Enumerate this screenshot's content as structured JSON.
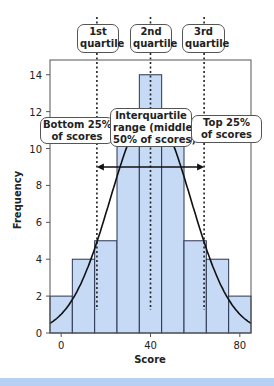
{
  "chart_data": {
    "type": "bar",
    "subtype": "histogram with normal curve",
    "title": "",
    "xlabel": "Score",
    "ylabel": "Frequency",
    "categories": [
      0,
      10,
      20,
      30,
      40,
      50,
      60,
      70,
      80
    ],
    "bin_width": 10,
    "values": [
      2,
      4,
      5,
      11,
      14,
      11,
      5,
      4,
      2
    ],
    "xlim": [
      -5,
      85
    ],
    "ylim": [
      0,
      14.8
    ],
    "x_ticks": [
      0,
      40,
      80
    ],
    "y_ticks": [
      0,
      2,
      4,
      6,
      8,
      10,
      12,
      14
    ],
    "grid": false,
    "normal_curve": {
      "mean": 40,
      "sd": 18,
      "peak": 12
    },
    "quartile_lines": [
      {
        "label_line1": "1st",
        "label_line2": "quartile",
        "x": 16
      },
      {
        "label_line1": "2nd",
        "label_line2": "quartile",
        "x": 40
      },
      {
        "label_line1": "3rd",
        "label_line2": "quartile",
        "x": 64
      }
    ],
    "annotations": [
      {
        "id": "bottom",
        "line1": "Bottom 25%",
        "line2": "of scores"
      },
      {
        "id": "iqr",
        "line1": "Interquartile",
        "line2": "range (middle",
        "line3": "50% of scores)"
      },
      {
        "id": "top",
        "line1": "Top 25%",
        "line2": "of scores"
      }
    ],
    "iqr_arrow": {
      "from": 16,
      "to": 64,
      "y": 9
    },
    "colors": {
      "bar_fill": "#c6d9f5",
      "bar_stroke": "#2a3550",
      "curve": "#111111",
      "band": "#b7cff2"
    }
  }
}
